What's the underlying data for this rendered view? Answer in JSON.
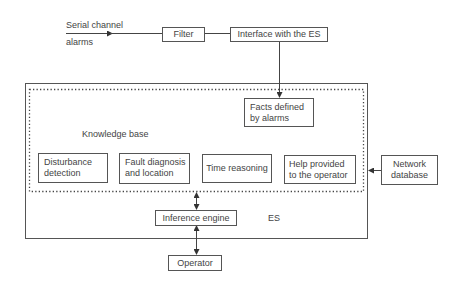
{
  "inputs": {
    "serial_top": "Serial channel",
    "serial_bottom": "alarms"
  },
  "nodes": {
    "filter": "Filter",
    "interface": "Interface with the ES",
    "facts": "Facts defined\nby alarms",
    "knowledge_base_label": "Knowledge base",
    "disturbance": "Disturbance\ndetection",
    "fault": "Fault diagnosis\nand location",
    "time": "Time reasoning",
    "help": "Help provided\nto the operator",
    "network": "Network\ndatabase",
    "inference": "Inference engine",
    "es_label": "ES",
    "operator": "Operator"
  },
  "edges": [
    {
      "from": "serial channel alarms",
      "to": "Filter"
    },
    {
      "from": "Filter",
      "to": "Interface with the ES"
    },
    {
      "from": "Interface with the ES",
      "to": "Facts defined by alarms"
    },
    {
      "from": "Network database",
      "to": "Knowledge base"
    },
    {
      "from": "Knowledge base",
      "to": "Inference engine",
      "bidirectional": true
    },
    {
      "from": "Inference engine",
      "to": "Operator",
      "bidirectional": true
    }
  ]
}
